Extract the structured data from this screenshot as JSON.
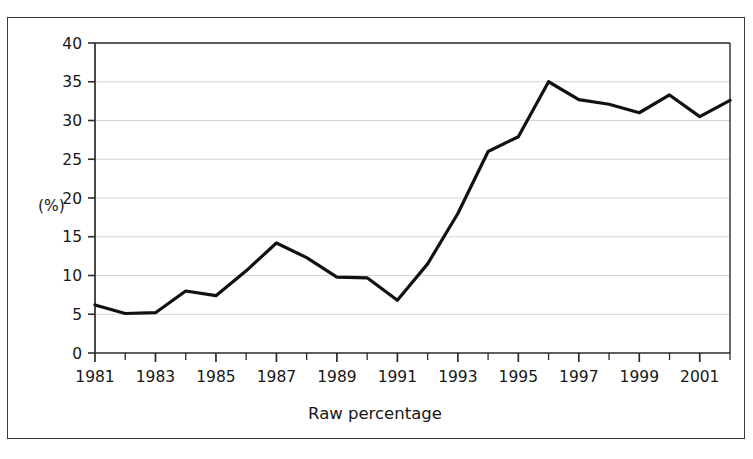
{
  "chart_data": {
    "type": "line",
    "title": "",
    "xlabel": "Raw percentage",
    "ylabel": "(%)",
    "x": [
      1981,
      1982,
      1983,
      1984,
      1985,
      1986,
      1987,
      1988,
      1989,
      1990,
      1991,
      1992,
      1993,
      1994,
      1995,
      1996,
      1997,
      1998,
      1999,
      2000,
      2001,
      2002
    ],
    "values": [
      6.2,
      5.1,
      5.2,
      8.0,
      7.4,
      10.6,
      14.2,
      12.3,
      9.8,
      9.7,
      6.8,
      11.5,
      18.0,
      26.0,
      27.9,
      35.0,
      32.7,
      32.1,
      31.0,
      33.3,
      30.5,
      32.6
    ],
    "series": [
      {
        "name": "Raw percentage",
        "values": [
          6.2,
          5.1,
          5.2,
          8.0,
          7.4,
          10.6,
          14.2,
          12.3,
          9.8,
          9.7,
          6.8,
          11.5,
          18.0,
          26.0,
          27.9,
          35.0,
          32.7,
          32.1,
          31.0,
          33.3,
          30.5,
          32.6
        ],
        "color": "#111111"
      }
    ],
    "xlim": [
      1981,
      2002
    ],
    "ylim": [
      0,
      40
    ],
    "yticks": [
      0,
      5,
      10,
      15,
      20,
      25,
      30,
      35,
      40
    ],
    "ytick_labels": [
      "0",
      "5",
      "10",
      "15",
      "20",
      "25",
      "30",
      "35",
      "40"
    ],
    "xticks": [
      1981,
      1982,
      1983,
      1984,
      1985,
      1986,
      1987,
      1988,
      1989,
      1990,
      1991,
      1992,
      1993,
      1994,
      1995,
      1996,
      1997,
      1998,
      1999,
      2000,
      2001,
      2002
    ],
    "xtick_labels_shown": [
      "1981",
      "1983",
      "1985",
      "1987",
      "1989",
      "1991",
      "1993",
      "1995",
      "1997",
      "1999",
      "2001"
    ],
    "xtick_label_years": [
      1981,
      1983,
      1985,
      1987,
      1989,
      1991,
      1993,
      1995,
      1997,
      1999,
      2001
    ],
    "grid": "horizontal",
    "grid_color": "#c9c9c9",
    "legend": null,
    "legend_position": "none",
    "axis_color": "#2b2b2b",
    "line_width": 3.2,
    "background": "#ffffff"
  },
  "axis": {
    "y_unit_label": "(%)",
    "x_title": "Raw percentage"
  }
}
